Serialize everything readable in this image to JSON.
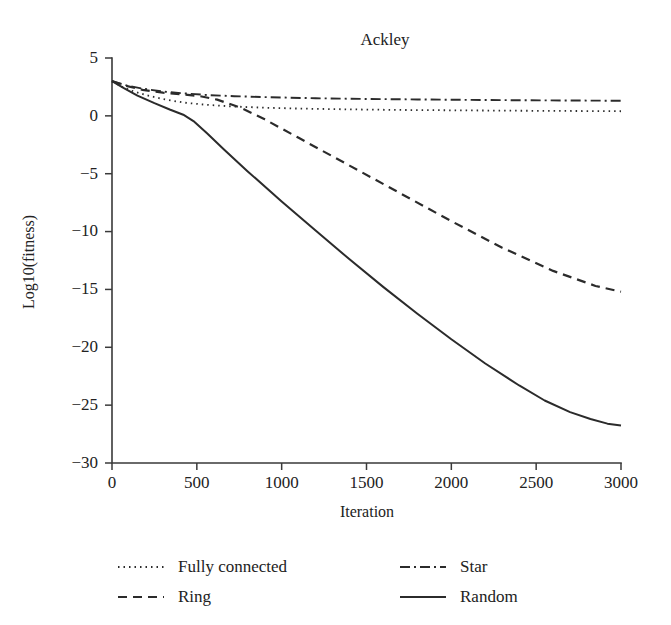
{
  "figure": {
    "background_color": "#ffffff",
    "ink_color": "#2b2b2b"
  },
  "chart_data": {
    "type": "line",
    "title": "Ackley",
    "xlabel": "Iteration",
    "ylabel": "Log10(fitness)",
    "xlim": [
      0,
      3000
    ],
    "ylim": [
      -30,
      5
    ],
    "xticks": [
      0,
      500,
      1000,
      1500,
      2000,
      2500,
      3000
    ],
    "yticks": [
      5,
      0,
      -5,
      -10,
      -15,
      -20,
      -25,
      -30
    ],
    "xticklabels": [
      "0",
      "500",
      "1000",
      "1500",
      "2000",
      "2500",
      "3000"
    ],
    "yticklabels": [
      "5",
      "0",
      "−5",
      "−10",
      "−15",
      "−20",
      "−25",
      "−30"
    ],
    "grid": false,
    "legend_position": "below",
    "legend_columns": 2,
    "series": [
      {
        "name": "Fully connected",
        "style": "dotted",
        "color": "#2b2b2b",
        "width": 1.8,
        "dasharray": "1.5,4",
        "x": [
          0,
          60,
          120,
          200,
          300,
          420,
          560,
          700,
          900,
          1100,
          1400,
          1700,
          2000,
          2300,
          2600,
          3000
        ],
        "y": [
          3.0,
          2.5,
          2.15,
          1.8,
          1.45,
          1.15,
          0.95,
          0.82,
          0.7,
          0.63,
          0.56,
          0.51,
          0.48,
          0.45,
          0.43,
          0.4
        ]
      },
      {
        "name": "Ring",
        "style": "dashed",
        "color": "#2b2b2b",
        "width": 2.2,
        "dasharray": "9,6",
        "x": [
          0,
          80,
          180,
          300,
          420,
          520,
          620,
          760,
          900,
          1100,
          1400,
          1700,
          2000,
          2300,
          2600,
          2850,
          3000
        ],
        "y": [
          3.0,
          2.6,
          2.25,
          2.0,
          1.85,
          1.7,
          1.4,
          0.7,
          -0.3,
          -1.9,
          -4.3,
          -6.7,
          -9.1,
          -11.4,
          -13.4,
          -14.7,
          -15.2
        ]
      },
      {
        "name": "Star",
        "style": "dashdot",
        "color": "#2b2b2b",
        "width": 1.9,
        "dasharray": "10,4,2,4",
        "x": [
          0,
          80,
          180,
          300,
          420,
          560,
          720,
          900,
          1200,
          1500,
          1800,
          2100,
          2400,
          2700,
          3000
        ],
        "y": [
          3.0,
          2.65,
          2.35,
          2.1,
          1.95,
          1.8,
          1.7,
          1.62,
          1.52,
          1.46,
          1.42,
          1.38,
          1.35,
          1.33,
          1.3
        ]
      },
      {
        "name": "Random",
        "style": "solid",
        "color": "#2b2b2b",
        "width": 2.0,
        "dasharray": "",
        "x": [
          0,
          70,
          150,
          250,
          340,
          420,
          480,
          560,
          660,
          800,
          1000,
          1200,
          1400,
          1600,
          1800,
          2000,
          2200,
          2400,
          2550,
          2700,
          2820,
          2920,
          3000
        ],
        "y": [
          3.0,
          2.4,
          1.75,
          1.1,
          0.55,
          0.1,
          -0.45,
          -1.5,
          -2.9,
          -4.8,
          -7.4,
          -9.9,
          -12.4,
          -14.8,
          -17.1,
          -19.3,
          -21.4,
          -23.3,
          -24.6,
          -25.6,
          -26.2,
          -26.6,
          -26.75
        ]
      }
    ]
  },
  "legend": {
    "entries": [
      {
        "label": "Fully connected",
        "style": "dotted"
      },
      {
        "label": "Star",
        "style": "dashdot"
      },
      {
        "label": "Ring",
        "style": "dashed"
      },
      {
        "label": "Random",
        "style": "solid"
      }
    ]
  }
}
